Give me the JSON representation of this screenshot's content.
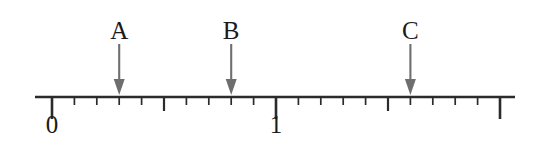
{
  "figure": {
    "type": "number-line-diagram",
    "background_color": "#ffffff",
    "axis_color": "#2b2b2b",
    "arrow_color": "#6e6e6e",
    "text_color": "#1a1a1a"
  },
  "chart_data": {
    "type": "number-line",
    "title": "",
    "xlabel": "",
    "ylabel": "",
    "axis_range": [
      -0.08,
      2.07
    ],
    "grid": false,
    "legend": "none",
    "tick_interval": 0.1,
    "labeled_ticks": [
      {
        "value": 0,
        "label": "0"
      },
      {
        "value": 1,
        "label": "1"
      }
    ],
    "major_tick_values": [
      0,
      1,
      2
    ],
    "medium_tick_values": [
      0.5,
      1.5
    ],
    "minor_tick_values": [
      0.1,
      0.2,
      0.3,
      0.4,
      0.6,
      0.7,
      0.8,
      0.9,
      1.1,
      1.2,
      1.3,
      1.4,
      1.6,
      1.7,
      1.8,
      1.9
    ],
    "markers": [
      {
        "name": "A",
        "value": 0.3
      },
      {
        "name": "B",
        "value": 0.8
      },
      {
        "name": "C",
        "value": 1.6
      }
    ]
  },
  "geometry": {
    "line_y": 97,
    "line_x_start": 35,
    "line_x_end": 515,
    "origin_x": 52,
    "unit_px": 224,
    "major_tick_len": 22,
    "medium_tick_len": 14,
    "minor_tick_len": 8,
    "arrow_top_y": 44,
    "label_baseline_y": 112,
    "marker_label_y": 18
  }
}
